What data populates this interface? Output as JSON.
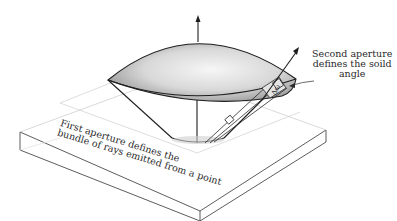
{
  "figure": {
    "type": "diagram",
    "labels": {
      "second_aperture": [
        "Second aperture",
        "defines the soild",
        "angle"
      ],
      "first_aperture": [
        "First aperture defines the",
        "bundle of rays emitted from a point"
      ],
      "delta_omega": "Δω"
    },
    "colors": {
      "line": "#1e1e1e",
      "lens_light": "#f4f4f4",
      "lens_dark": "#9a9a9a",
      "slab_line": "#333333",
      "guide_line": "#cfcfcf"
    }
  }
}
